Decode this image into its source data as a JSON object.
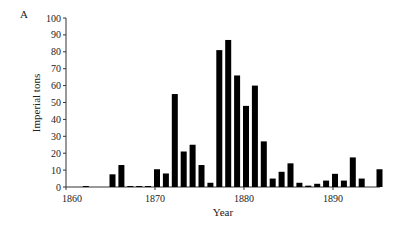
{
  "chart_data": {
    "type": "bar",
    "panel_label": "A",
    "title": "",
    "xlabel": "Year",
    "ylabel": "Imperial tons",
    "ylim": [
      0,
      100
    ],
    "xlim": [
      1860,
      1896
    ],
    "yticks": [
      0,
      10,
      20,
      30,
      40,
      50,
      60,
      70,
      80,
      90,
      100
    ],
    "xticks": [
      1860,
      1870,
      1880,
      1890
    ],
    "grid": false,
    "legend": null,
    "bar_color": "#000000",
    "categories": [
      1862,
      1865,
      1866,
      1867,
      1868,
      1869,
      1870,
      1871,
      1872,
      1873,
      1874,
      1875,
      1876,
      1877,
      1878,
      1879,
      1880,
      1881,
      1882,
      1883,
      1884,
      1885,
      1886,
      1887,
      1888,
      1889,
      1890,
      1891,
      1892,
      1893,
      1895
    ],
    "values": [
      0.5,
      7.5,
      13,
      0.5,
      0.5,
      0.5,
      10.5,
      8,
      55,
      21,
      25,
      13,
      2.5,
      81,
      87,
      66,
      48,
      60,
      27,
      5,
      9,
      14,
      2.5,
      0.8,
      1.9,
      3.8,
      7.8,
      3.8,
      17.5,
      5,
      10.5
    ]
  }
}
